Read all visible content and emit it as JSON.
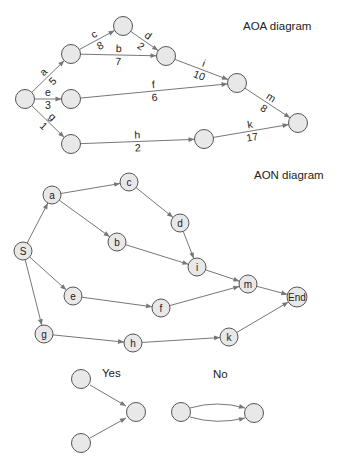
{
  "aoa": {
    "title": "AOA diagram",
    "nodes": [
      {
        "id": "n1",
        "x": 25,
        "y": 99
      },
      {
        "id": "n2",
        "x": 71,
        "y": 54
      },
      {
        "id": "n3",
        "x": 123,
        "y": 26
      },
      {
        "id": "n4",
        "x": 166,
        "y": 56
      },
      {
        "id": "n5",
        "x": 71,
        "y": 99
      },
      {
        "id": "n6",
        "x": 71,
        "y": 144
      },
      {
        "id": "n7",
        "x": 237,
        "y": 83
      },
      {
        "id": "n8",
        "x": 298,
        "y": 123
      },
      {
        "id": "n9",
        "x": 204,
        "y": 139
      }
    ],
    "activities": [
      {
        "name": "a",
        "duration": "5",
        "from": "n1",
        "to": "n2"
      },
      {
        "name": "c",
        "duration": "8",
        "from": "n2",
        "to": "n3"
      },
      {
        "name": "b",
        "duration": "7",
        "from": "n2",
        "to": "n4"
      },
      {
        "name": "d",
        "duration": "2",
        "from": "n3",
        "to": "n4"
      },
      {
        "name": "e",
        "duration": "3",
        "from": "n1",
        "to": "n5"
      },
      {
        "name": "f",
        "duration": "6",
        "from": "n5",
        "to": "n7"
      },
      {
        "name": "g",
        "duration": "1",
        "from": "n1",
        "to": "n6"
      },
      {
        "name": "h",
        "duration": "2",
        "from": "n6",
        "to": "n9"
      },
      {
        "name": "i",
        "duration": "10",
        "from": "n4",
        "to": "n7"
      },
      {
        "name": "m",
        "duration": "8",
        "from": "n7",
        "to": "n8"
      },
      {
        "name": "k",
        "duration": "17",
        "from": "n9",
        "to": "n8"
      }
    ]
  },
  "aon": {
    "title": "AON diagram",
    "nodes": [
      {
        "id": "S",
        "label": "S",
        "x": 23,
        "y": 251
      },
      {
        "id": "a",
        "label": "a",
        "x": 52,
        "y": 195
      },
      {
        "id": "c",
        "label": "c",
        "x": 129,
        "y": 182
      },
      {
        "id": "b",
        "label": "b",
        "x": 117,
        "y": 242
      },
      {
        "id": "d",
        "label": "d",
        "x": 180,
        "y": 223
      },
      {
        "id": "i",
        "label": "i",
        "x": 197,
        "y": 267
      },
      {
        "id": "e",
        "label": "e",
        "x": 73,
        "y": 296
      },
      {
        "id": "f",
        "label": "f",
        "x": 161,
        "y": 308
      },
      {
        "id": "m",
        "label": "m",
        "x": 248,
        "y": 284
      },
      {
        "id": "End",
        "label": "End",
        "x": 297,
        "y": 297
      },
      {
        "id": "g",
        "label": "g",
        "x": 44,
        "y": 334
      },
      {
        "id": "h",
        "label": "h",
        "x": 133,
        "y": 343
      },
      {
        "id": "k",
        "label": "k",
        "x": 229,
        "y": 337
      }
    ],
    "edges": [
      [
        "S",
        "a"
      ],
      [
        "a",
        "c"
      ],
      [
        "a",
        "b"
      ],
      [
        "c",
        "d"
      ],
      [
        "d",
        "i"
      ],
      [
        "b",
        "i"
      ],
      [
        "S",
        "e"
      ],
      [
        "e",
        "f"
      ],
      [
        "i",
        "m"
      ],
      [
        "f",
        "m"
      ],
      [
        "m",
        "End"
      ],
      [
        "S",
        "g"
      ],
      [
        "g",
        "h"
      ],
      [
        "h",
        "k"
      ],
      [
        "k",
        "End"
      ]
    ]
  },
  "examples": {
    "yes_label": "Yes",
    "no_label": "No"
  }
}
